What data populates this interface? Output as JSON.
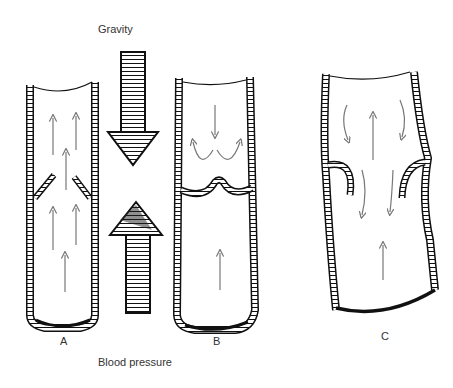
{
  "labels": {
    "gravity": "Gravity",
    "blood_pressure": "Blood pressure",
    "panel_a": "A",
    "panel_b": "B",
    "panel_c": "C"
  },
  "colors": {
    "ink": "#111111",
    "flow_arrow": "#777777",
    "background": "#ffffff"
  }
}
